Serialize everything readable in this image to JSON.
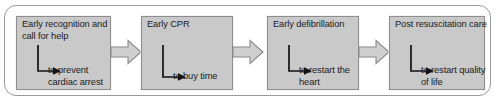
{
  "diagram": {
    "colors": {
      "box_fill": "#c9c9c9",
      "box_border": "#8d8d8d",
      "frame_border": "#9a9a9a",
      "arrow_fill": "#cfcfcf",
      "arrow_border": "#8a8a8a",
      "text": "#1b1b1b",
      "background": "#ffffff"
    },
    "stages": [
      {
        "title": "Early recognition and call for help",
        "outcome": "to prevent cardiac arrest"
      },
      {
        "title": "Early CPR",
        "outcome": "to buy time"
      },
      {
        "title": "Early defibrillation",
        "outcome": "to restart the heart"
      },
      {
        "title": "Post resuscitation care",
        "outcome": "to restart quality of life"
      }
    ],
    "connectors": [
      {
        "name": "connector-arrow-1-to-2"
      },
      {
        "name": "connector-arrow-2-to-3"
      },
      {
        "name": "connector-arrow-3-to-4"
      }
    ]
  }
}
